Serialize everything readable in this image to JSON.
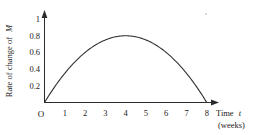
{
  "chart_data": {
    "type": "line",
    "title": "",
    "subtitle": "",
    "xlabel": "Time t",
    "xlabel_unit": "(weeks)",
    "xlabel_main": "Time",
    "xlabel_variable": "t",
    "ylabel": "Rate of change of M",
    "ylabel_main": "Rate of change of",
    "ylabel_variable": "M",
    "origin_label": "O",
    "xlim": [
      0,
      8
    ],
    "ylim": [
      0,
      1
    ],
    "grid": false,
    "legend": "none",
    "x_ticks": [
      "1",
      "2",
      "3",
      "4",
      "5",
      "6",
      "7",
      "8"
    ],
    "x_tick_values": [
      1,
      2,
      3,
      4,
      5,
      6,
      7,
      8
    ],
    "y_ticks": [
      "0.2",
      "0.4",
      "0.6",
      "0.8",
      "1"
    ],
    "y_tick_values": [
      0.2,
      0.4,
      0.6,
      0.8,
      1
    ],
    "series": [
      {
        "name": "Rate of change of M",
        "equation": "0.2*t*(8-t)",
        "x": [
          0,
          0.5,
          1,
          1.5,
          2,
          2.5,
          3,
          3.5,
          4,
          4.5,
          5,
          5.5,
          6,
          6.5,
          7,
          7.5,
          8
        ],
        "values": [
          0,
          0.75,
          1.4,
          1.95,
          2.4,
          2.75,
          3.0,
          3.15,
          3.2,
          3.15,
          3.0,
          2.75,
          2.4,
          1.95,
          1.4,
          0.75,
          0
        ],
        "y": [
          0,
          0.1875,
          0.35,
          0.4875,
          0.6,
          0.6875,
          0.75,
          0.7875,
          0.8,
          0.7875,
          0.75,
          0.6875,
          0.6,
          0.4875,
          0.35,
          0.1875,
          0
        ],
        "peak_x": 4,
        "peak_y": 0.8,
        "zeros": [
          0,
          8
        ]
      }
    ],
    "colors": {
      "curve": "#333333",
      "axis": "#2b2b2b",
      "text": "#1a1a1a",
      "background": "#ffffff"
    }
  }
}
